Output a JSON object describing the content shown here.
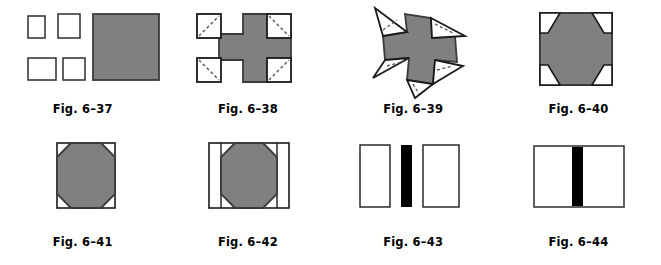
{
  "page": {
    "background_color": "#ffffff",
    "gray_fill": "#808080",
    "black_fill": "#000000",
    "white_fill": "#ffffff",
    "outline_color": "#3a3a3a",
    "dash_color": "#555555"
  },
  "figures": [
    {
      "id": "fig-6-37",
      "caption": "Fig. 6–37",
      "description": "Four small outlined white squares at left and one large gray square at right",
      "shapes": "four-small-squares-and-large-gray-square"
    },
    {
      "id": "fig-6-38",
      "caption": "Fig. 6–38",
      "description": "Gray plus/cross shape with four white corner squares each crossed by a dashed diagonal",
      "shapes": "gray-cross-with-four-dashed-corner-squares"
    },
    {
      "id": "fig-6-39",
      "caption": "Fig. 6–39",
      "description": "Gray pinwheel cross with four white triangles folded outward, each with a dashed fold line",
      "shapes": "gray-cross-with-four-outward-folded-triangles"
    },
    {
      "id": "fig-6-40",
      "caption": "Fig. 6–40",
      "description": "Gray octagon inside a square with four white corner flaps folding inward",
      "shapes": "gray-octagon-with-inward-folding-corner-flaps"
    },
    {
      "id": "fig-6-41",
      "caption": "Fig. 6–41",
      "description": "Gray octagon inscribed in an outlined square with white corners",
      "shapes": "gray-octagon-in-square"
    },
    {
      "id": "fig-6-42",
      "caption": "Fig. 6–42",
      "description": "Gray octagon in a wider outlined rectangle with white vertical strips at left and right",
      "shapes": "gray-octagon-in-rectangle-with-side-strips"
    },
    {
      "id": "fig-6-43",
      "caption": "Fig. 6–43",
      "description": "Two separated white outlined rectangles with a solid black vertical bar between them",
      "shapes": "two-white-rectangles-with-separate-black-bar"
    },
    {
      "id": "fig-6-44",
      "caption": "Fig. 6–44",
      "description": "Single white outlined rectangle with a solid black vertical bar through the center",
      "shapes": "white-rectangle-with-centered-black-bar"
    }
  ]
}
